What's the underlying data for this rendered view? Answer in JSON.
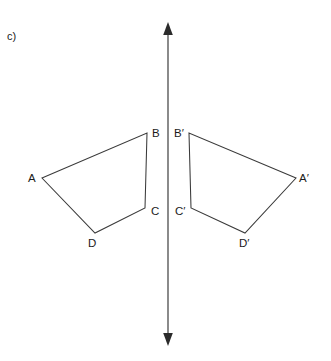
{
  "figure": {
    "part_label": "c)",
    "background_color": "#ffffff",
    "stroke_color": "#3a3a3a",
    "axis_color": "#2b2b2b",
    "text_color": "#1b1b1b",
    "width": 331,
    "height": 361
  },
  "mirror_line": {
    "name": "line-of-reflection",
    "orientation": "vertical",
    "x": 168,
    "y_top": 25,
    "y_bottom": 343,
    "arrow_top": true,
    "arrow_bottom": true
  },
  "shapes": [
    {
      "name": "quadrilateral-abcd",
      "id": "preimage",
      "points": "42,178 147,133 145,208 95,233",
      "vertices": [
        {
          "label": "A",
          "x": 42,
          "y": 178,
          "label_x": 28,
          "label_y": 173
        },
        {
          "label": "B",
          "x": 147,
          "y": 133,
          "label_x": 152,
          "label_y": 128
        },
        {
          "label": "C",
          "x": 145,
          "y": 208,
          "label_x": 151,
          "label_y": 206
        },
        {
          "label": "D",
          "x": 95,
          "y": 233,
          "label_x": 88,
          "label_y": 238
        }
      ]
    },
    {
      "name": "quadrilateral-a-prime-b-prime-c-prime-d-prime",
      "id": "image",
      "points": "296,178 189,133 191,208 245,233",
      "vertices": [
        {
          "label": "A′",
          "x": 296,
          "y": 178,
          "label_x": 299,
          "label_y": 173
        },
        {
          "label": "B′",
          "x": 189,
          "y": 133,
          "label_x": 174,
          "label_y": 128
        },
        {
          "label": "C′",
          "x": 191,
          "y": 208,
          "label_x": 175,
          "label_y": 206
        },
        {
          "label": "D′",
          "x": 245,
          "y": 233,
          "label_x": 239,
          "label_y": 238
        }
      ]
    }
  ]
}
